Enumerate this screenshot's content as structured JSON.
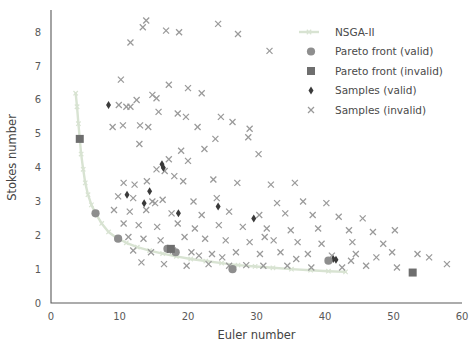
{
  "figure": {
    "background": "#ffffff",
    "width": 472,
    "height": 349
  },
  "axes": {
    "x_title": "Euler number",
    "y_title": "Stokes number",
    "x_ticks": [
      "0",
      "10",
      "20",
      "30",
      "40",
      "50",
      "60"
    ],
    "y_ticks": [
      "0",
      "1",
      "2",
      "3",
      "4",
      "5",
      "6",
      "7",
      "8"
    ],
    "spine_color": "#5a5a5a",
    "tick_color": "#595959"
  },
  "legend": {
    "entries": [
      {
        "label": "NSGA-II",
        "marker": "line",
        "color": "#d8e3d2"
      },
      {
        "label": "Pareto front (valid)",
        "marker": "circle",
        "color": "#8e8e8e"
      },
      {
        "label": "Pareto front (invalid)",
        "marker": "square",
        "color": "#6e6e6e"
      },
      {
        "label": "Samples (valid)",
        "marker": "diamond",
        "color": "#3a3a3a"
      },
      {
        "label": "Samples (invalid)",
        "marker": "cross",
        "color": "#9a9a9a"
      }
    ]
  },
  "chart_data": {
    "type": "scatter",
    "title": "",
    "xlabel": "Euler number",
    "ylabel": "Stokes number",
    "xlim": [
      0,
      60
    ],
    "ylim": [
      0,
      8.6
    ],
    "grid": false,
    "legend_position": "top-right",
    "series": [
      {
        "name": "NSGA-II",
        "type": "line",
        "color": "#d8e3d2",
        "points": [
          [
            3.6,
            6.2
          ],
          [
            3.8,
            5.8
          ],
          [
            4.0,
            5.3
          ],
          [
            4.2,
            4.85
          ],
          [
            4.4,
            4.4
          ],
          [
            4.7,
            3.95
          ],
          [
            5.0,
            3.55
          ],
          [
            5.4,
            3.2
          ],
          [
            5.9,
            2.9
          ],
          [
            6.5,
            2.65
          ],
          [
            7.4,
            2.35
          ],
          [
            8.4,
            2.1
          ],
          [
            9.6,
            1.92
          ],
          [
            11.0,
            1.78
          ],
          [
            12.6,
            1.65
          ],
          [
            14.4,
            1.55
          ],
          [
            16.3,
            1.46
          ],
          [
            18.3,
            1.38
          ],
          [
            20.4,
            1.3
          ],
          [
            22.6,
            1.24
          ],
          [
            24.9,
            1.18
          ],
          [
            27.3,
            1.12
          ],
          [
            29.8,
            1.08
          ],
          [
            32.4,
            1.04
          ],
          [
            35.1,
            1.0
          ],
          [
            37.9,
            0.97
          ],
          [
            40.5,
            0.94
          ],
          [
            43.0,
            0.92
          ]
        ]
      },
      {
        "name": "Pareto front (valid)",
        "type": "scatter",
        "marker": "circle",
        "color": "#8e8e8e",
        "points": [
          [
            6.5,
            2.65
          ],
          [
            9.8,
            1.9
          ],
          [
            17.0,
            1.6
          ],
          [
            18.2,
            1.5
          ],
          [
            26.5,
            1.0
          ],
          [
            40.5,
            1.25
          ]
        ]
      },
      {
        "name": "Pareto front (invalid)",
        "type": "scatter",
        "marker": "square",
        "color": "#6e6e6e",
        "points": [
          [
            4.2,
            4.85
          ],
          [
            17.5,
            1.6
          ],
          [
            52.8,
            0.9
          ]
        ]
      },
      {
        "name": "Samples (valid)",
        "type": "scatter",
        "marker": "diamond",
        "color": "#3a3a3a",
        "points": [
          [
            8.4,
            5.85
          ],
          [
            11.1,
            3.2
          ],
          [
            14.4,
            3.3
          ],
          [
            16.2,
            4.1
          ],
          [
            16.4,
            4.0
          ],
          [
            13.6,
            2.95
          ],
          [
            18.6,
            2.65
          ],
          [
            24.4,
            2.85
          ],
          [
            29.6,
            2.5
          ],
          [
            41.2,
            1.3
          ],
          [
            41.6,
            1.28
          ]
        ]
      },
      {
        "name": "Samples (invalid)",
        "type": "scatter",
        "marker": "cross",
        "color": "#9a9a9a",
        "points": [
          [
            13.4,
            8.15
          ],
          [
            13.9,
            8.35
          ],
          [
            16.8,
            8.05
          ],
          [
            18.7,
            8.0
          ],
          [
            24.4,
            8.25
          ],
          [
            27.3,
            7.95
          ],
          [
            11.6,
            7.7
          ],
          [
            31.9,
            7.45
          ],
          [
            10.2,
            6.6
          ],
          [
            12.5,
            6.0
          ],
          [
            14.8,
            6.15
          ],
          [
            15.4,
            6.05
          ],
          [
            17.2,
            6.45
          ],
          [
            20.0,
            6.35
          ],
          [
            22.0,
            6.2
          ],
          [
            9.9,
            5.85
          ],
          [
            11.0,
            5.8
          ],
          [
            11.6,
            5.8
          ],
          [
            15.7,
            5.65
          ],
          [
            18.5,
            5.6
          ],
          [
            19.7,
            5.5
          ],
          [
            24.8,
            5.5
          ],
          [
            9.0,
            5.2
          ],
          [
            10.5,
            5.25
          ],
          [
            13.0,
            5.25
          ],
          [
            14.2,
            5.2
          ],
          [
            21.4,
            5.2
          ],
          [
            26.5,
            5.35
          ],
          [
            29.0,
            5.15
          ],
          [
            12.9,
            4.7
          ],
          [
            19.0,
            4.5
          ],
          [
            22.4,
            4.55
          ],
          [
            17.2,
            4.25
          ],
          [
            20.0,
            4.2
          ],
          [
            30.3,
            4.4
          ],
          [
            15.4,
            3.95
          ],
          [
            16.6,
            3.9
          ],
          [
            10.6,
            3.55
          ],
          [
            12.2,
            3.5
          ],
          [
            14.0,
            3.6
          ],
          [
            18.0,
            3.75
          ],
          [
            19.3,
            3.6
          ],
          [
            23.7,
            3.65
          ],
          [
            27.2,
            3.55
          ],
          [
            32.1,
            3.5
          ],
          [
            35.6,
            3.55
          ],
          [
            9.8,
            3.15
          ],
          [
            12.0,
            3.1
          ],
          [
            14.8,
            3.0
          ],
          [
            15.2,
            2.95
          ],
          [
            16.3,
            3.05
          ],
          [
            20.8,
            3.0
          ],
          [
            24.2,
            3.1
          ],
          [
            9.2,
            2.75
          ],
          [
            11.5,
            2.7
          ],
          [
            13.9,
            2.75
          ],
          [
            17.6,
            2.65
          ],
          [
            22.0,
            2.6
          ],
          [
            26.0,
            2.7
          ],
          [
            30.4,
            2.6
          ],
          [
            34.2,
            2.65
          ],
          [
            38.2,
            2.6
          ],
          [
            42.0,
            2.55
          ],
          [
            45.5,
            2.5
          ],
          [
            10.6,
            2.35
          ],
          [
            12.8,
            2.3
          ],
          [
            15.5,
            2.25
          ],
          [
            18.5,
            2.35
          ],
          [
            21.0,
            2.2
          ],
          [
            24.5,
            2.3
          ],
          [
            28.0,
            2.25
          ],
          [
            31.5,
            2.2
          ],
          [
            35.0,
            2.15
          ],
          [
            39.0,
            2.2
          ],
          [
            43.5,
            2.15
          ],
          [
            47.0,
            2.1
          ],
          [
            50.2,
            2.15
          ],
          [
            11.3,
            1.95
          ],
          [
            13.5,
            1.9
          ],
          [
            16.0,
            1.85
          ],
          [
            19.5,
            1.95
          ],
          [
            22.5,
            1.9
          ],
          [
            25.5,
            1.85
          ],
          [
            29.0,
            1.8
          ],
          [
            32.5,
            1.85
          ],
          [
            36.0,
            1.8
          ],
          [
            39.5,
            1.75
          ],
          [
            44.0,
            1.8
          ],
          [
            48.5,
            1.75
          ],
          [
            12.0,
            1.55
          ],
          [
            14.6,
            1.5
          ],
          [
            17.8,
            1.55
          ],
          [
            20.5,
            1.5
          ],
          [
            23.5,
            1.45
          ],
          [
            27.0,
            1.5
          ],
          [
            30.5,
            1.45
          ],
          [
            33.5,
            1.5
          ],
          [
            37.5,
            1.45
          ],
          [
            41.0,
            1.4
          ],
          [
            44.5,
            1.45
          ],
          [
            49.8,
            1.5
          ],
          [
            55.2,
            1.35
          ],
          [
            57.8,
            1.15
          ],
          [
            13.2,
            1.2
          ],
          [
            16.5,
            1.15
          ],
          [
            19.8,
            1.1
          ],
          [
            23.0,
            1.15
          ],
          [
            26.0,
            1.1
          ],
          [
            28.5,
            1.12
          ],
          [
            31.0,
            1.1
          ],
          [
            34.5,
            1.1
          ],
          [
            38.0,
            1.05
          ],
          [
            42.5,
            1.05
          ],
          [
            46.0,
            1.1
          ],
          [
            50.5,
            1.05
          ],
          [
            21.6,
            1.4
          ],
          [
            25.0,
            1.35
          ],
          [
            35.8,
            1.3
          ],
          [
            43.8,
            1.25
          ],
          [
            47.5,
            1.35
          ],
          [
            33.0,
            2.95
          ],
          [
            36.8,
            3.0
          ],
          [
            40.2,
            2.95
          ],
          [
            28.8,
            4.9
          ],
          [
            24.0,
            4.85
          ],
          [
            31.2,
            1.95
          ],
          [
            53.5,
            1.45
          ]
        ]
      }
    ]
  }
}
